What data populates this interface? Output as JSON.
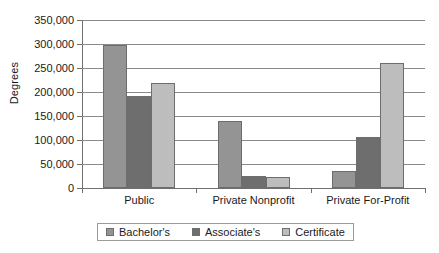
{
  "chart_data": {
    "type": "bar",
    "title": "",
    "subtitle": "",
    "xlabel": "",
    "ylabel": "Degrees",
    "categories": [
      "Public",
      "Private Nonprofit",
      "Private For-Profit"
    ],
    "series": [
      {
        "name": "Bachelor's",
        "color": "#949494",
        "values": [
          297000,
          139000,
          36000
        ]
      },
      {
        "name": "Associate's",
        "color": "#6e6e6e",
        "values": [
          192000,
          24000,
          106000
        ]
      },
      {
        "name": "Certificate",
        "color": "#bdbdbd",
        "values": [
          219000,
          22000,
          261000
        ]
      }
    ],
    "ylim": [
      0,
      350000
    ],
    "ytick_values": [
      0,
      50000,
      100000,
      150000,
      200000,
      250000,
      300000,
      350000
    ],
    "ytick_labels": [
      "0",
      "50,000",
      "100,000",
      "150,000",
      "200,000",
      "250,000",
      "300,000",
      "350,000"
    ],
    "grid": true,
    "legend_position": "bottom",
    "axis_color": "#6f6f6f",
    "gridline_color": "#8a8a8a",
    "background": "#ffffff"
  }
}
